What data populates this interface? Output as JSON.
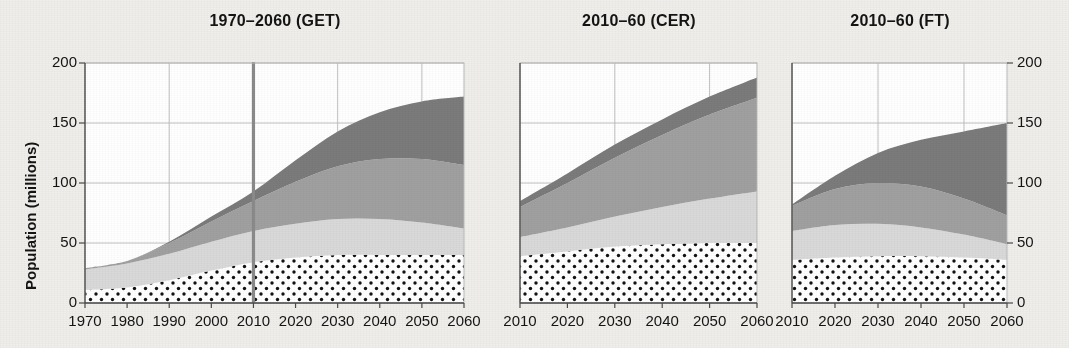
{
  "figure": {
    "kind": "stacked-area-panels",
    "y_axis_label": "Population (millions)",
    "y_ticks": [
      0,
      50,
      100,
      150,
      200
    ],
    "y_range": [
      0,
      200
    ],
    "left_axis_visible": true,
    "right_axis_visible": true
  },
  "panels": [
    {
      "id": "get",
      "title": "1970–2060 (GET)",
      "x_ticks": [
        1970,
        1980,
        1990,
        2000,
        2010,
        2020,
        2030,
        2040,
        2050,
        2060
      ],
      "x_range": [
        1970,
        2060
      ],
      "divider_year": 2010,
      "has_divider": true
    },
    {
      "id": "cer",
      "title": "2010–60 (CER)",
      "x_ticks": [
        2010,
        2020,
        2030,
        2040,
        2050,
        2060
      ],
      "x_range": [
        2010,
        2060
      ],
      "divider_year": null,
      "has_divider": false
    },
    {
      "id": "ft",
      "title": "2010–60 (FT)",
      "x_ticks": [
        2010,
        2020,
        2030,
        2040,
        2050,
        2060
      ],
      "x_range": [
        2010,
        2060
      ],
      "divider_year": null,
      "has_divider": false
    }
  ],
  "colors": {
    "band_1_dotted_fill": "#ffffff",
    "band_1_dot": "#111111",
    "band_2_light": "#d9d9d9",
    "band_3_medium": "#a0a0a0",
    "band_4_dark": "#7b7b7b",
    "grid": "#b9b9b9",
    "axis": "#4a4a4a",
    "divider": "#8a8a8a",
    "paper": "#efeeea",
    "plot_bg": "#ffffff",
    "text": "#141414"
  },
  "chart_data": [
    {
      "type": "area",
      "title": "1970–2060 (GET)",
      "xlabel": "",
      "ylabel": "Population (millions)",
      "ylim": [
        0,
        200
      ],
      "xlim": [
        1970,
        2060
      ],
      "grid": true,
      "legend": "none",
      "stacked": true,
      "annotations": [
        {
          "type": "vline",
          "x": 2010,
          "label": "history / projection divide"
        }
      ],
      "x": [
        1970,
        1980,
        1990,
        2000,
        2010,
        2020,
        2030,
        2040,
        2050,
        2060
      ],
      "series": [
        {
          "name": "band-1-dotted",
          "values": [
            11,
            13,
            19,
            27,
            34,
            38,
            40,
            40,
            40,
            40
          ]
        },
        {
          "name": "band-2-light",
          "values": [
            17,
            20,
            22,
            24,
            26,
            28,
            30,
            30,
            27,
            22
          ]
        },
        {
          "name": "band-3-medium",
          "values": [
            1,
            2,
            9,
            17,
            25,
            35,
            44,
            50,
            53,
            53
          ]
        },
        {
          "name": "band-4-dark",
          "values": [
            0,
            0,
            1,
            4,
            8,
            18,
            29,
            39,
            48,
            57
          ]
        }
      ],
      "cumulative_totals": [
        29,
        35,
        51,
        72,
        93,
        119,
        143,
        159,
        168,
        172
      ],
      "stack_top_levels": {
        "band_1": [
          11,
          13,
          19,
          27,
          34,
          38,
          40,
          40,
          40,
          40
        ],
        "band_2": [
          28,
          33,
          41,
          51,
          60,
          66,
          70,
          70,
          67,
          62
        ],
        "band_3": [
          29,
          35,
          50,
          68,
          85,
          101,
          114,
          120,
          120,
          115
        ],
        "band_4": [
          29,
          35,
          51,
          72,
          93,
          119,
          143,
          159,
          168,
          172
        ]
      }
    },
    {
      "type": "area",
      "title": "2010–60 (CER)",
      "xlabel": "",
      "ylabel": "",
      "ylim": [
        0,
        200
      ],
      "xlim": [
        2010,
        2060
      ],
      "grid": true,
      "legend": "none",
      "stacked": true,
      "annotations": [],
      "x": [
        2010,
        2020,
        2030,
        2040,
        2050,
        2060
      ],
      "series": [
        {
          "name": "band-1-dotted",
          "values": [
            39,
            43,
            47,
            49,
            50,
            50
          ]
        },
        {
          "name": "band-2-light",
          "values": [
            16,
            20,
            25,
            31,
            37,
            43
          ]
        },
        {
          "name": "band-3-medium",
          "values": [
            25,
            37,
            49,
            60,
            70,
            78
          ]
        },
        {
          "name": "band-4-dark",
          "values": [
            5,
            8,
            11,
            13,
            15,
            17
          ]
        }
      ],
      "cumulative_totals": [
        85,
        108,
        132,
        153,
        172,
        188
      ],
      "stack_top_levels": {
        "band_1": [
          39,
          43,
          47,
          49,
          50,
          50
        ],
        "band_2": [
          55,
          63,
          72,
          80,
          87,
          93
        ],
        "band_3": [
          80,
          100,
          121,
          140,
          157,
          171
        ],
        "band_4": [
          85,
          108,
          132,
          153,
          172,
          188
        ]
      }
    },
    {
      "type": "area",
      "title": "2010–60 (FT)",
      "xlabel": "",
      "ylabel": "",
      "ylim": [
        0,
        200
      ],
      "xlim": [
        2010,
        2060
      ],
      "grid": true,
      "legend": "none",
      "stacked": true,
      "annotations": [],
      "x": [
        2010,
        2020,
        2030,
        2040,
        2050,
        2060
      ],
      "series": [
        {
          "name": "band-1-dotted",
          "values": [
            36,
            38,
            39,
            39,
            38,
            36
          ]
        },
        {
          "name": "band-2-light",
          "values": [
            24,
            27,
            27,
            24,
            19,
            13
          ]
        },
        {
          "name": "band-3-medium",
          "values": [
            21,
            30,
            34,
            34,
            30,
            24
          ]
        },
        {
          "name": "band-4-dark",
          "values": [
            1,
            11,
            25,
            39,
            56,
            77
          ]
        }
      ],
      "cumulative_totals": [
        82,
        106,
        125,
        136,
        143,
        150
      ],
      "stack_top_levels": {
        "band_1": [
          36,
          38,
          39,
          39,
          38,
          36
        ],
        "band_2": [
          60,
          65,
          66,
          63,
          57,
          49
        ],
        "band_3": [
          81,
          95,
          100,
          97,
          87,
          73
        ],
        "band_4": [
          82,
          106,
          125,
          136,
          143,
          150
        ]
      }
    }
  ]
}
